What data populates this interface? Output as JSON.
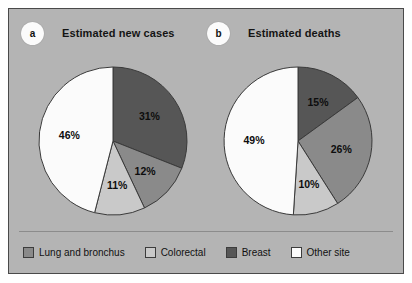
{
  "figure": {
    "background_color": "#b4b4b4",
    "border_color": "#4a4a4a"
  },
  "panels": [
    {
      "tag": "a",
      "title": "Estimated new cases"
    },
    {
      "tag": "b",
      "title": "Estimated deaths"
    }
  ],
  "legend": {
    "items": [
      {
        "label": "Lung and bronchus",
        "color": "#8a8a8a"
      },
      {
        "label": "Colorectal",
        "color": "#c9c9c9"
      },
      {
        "label": "Breast",
        "color": "#565656"
      },
      {
        "label": "Other site",
        "color": "#fbfbfb"
      }
    ]
  },
  "chart_data": [
    {
      "type": "pie",
      "title": "Estimated new cases",
      "panel_tag": "a",
      "categories": [
        "Breast",
        "Lung and bronchus",
        "Colorectal",
        "Other site"
      ],
      "values": [
        31,
        12,
        11,
        46
      ],
      "labels": [
        "31%",
        "12%",
        "11%",
        "46%"
      ],
      "colors": [
        "#565656",
        "#8a8a8a",
        "#c9c9c9",
        "#fbfbfb"
      ],
      "start_angle_deg": 0,
      "direction": "clockwise",
      "units": "percent",
      "legend_position": "bottom"
    },
    {
      "type": "pie",
      "title": "Estimated deaths",
      "panel_tag": "b",
      "categories": [
        "Breast",
        "Lung and bronchus",
        "Colorectal",
        "Other site"
      ],
      "values": [
        15,
        26,
        10,
        49
      ],
      "labels": [
        "15%",
        "26%",
        "10%",
        "49%"
      ],
      "colors": [
        "#565656",
        "#8a8a8a",
        "#c9c9c9",
        "#fbfbfb"
      ],
      "start_angle_deg": 0,
      "direction": "clockwise",
      "units": "percent",
      "legend_position": "bottom"
    }
  ]
}
